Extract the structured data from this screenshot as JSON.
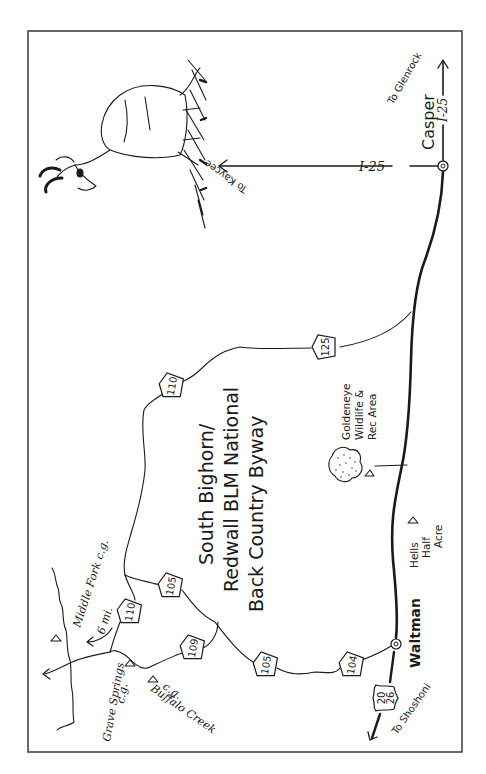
{
  "map": {
    "title_lines": [
      "South Bighorn/",
      "Redwall BLM National",
      "Back Country Byway"
    ],
    "orientation": "rotated 90° (north points right)",
    "cities": [
      {
        "name": "Casper"
      },
      {
        "name": "Waltman"
      }
    ],
    "interstate": {
      "label_west": "I-25",
      "label_east": "I-25"
    },
    "destinations": {
      "kaycee": "To Kaycee",
      "glenrock": "To Glenrock",
      "shoshoni": "To Shoshoni"
    },
    "routes": [
      {
        "id": "125",
        "label": "125"
      },
      {
        "id": "110a",
        "label": "110"
      },
      {
        "id": "110b",
        "label": "110"
      },
      {
        "id": "105a",
        "label": "105"
      },
      {
        "id": "105b",
        "label": "105"
      },
      {
        "id": "109",
        "label": "109"
      },
      {
        "id": "104",
        "label": "104"
      },
      {
        "id": "us20",
        "label": "20"
      },
      {
        "id": "us26",
        "label": "26"
      }
    ],
    "places": {
      "goldeneye_1": "Goldeneye",
      "goldeneye_2": "Wildlife &",
      "goldeneye_3": "Rec Area",
      "hells_1": "Hells",
      "hells_2": "Half",
      "hells_3": "Acre",
      "middle_fork": "Middle Fork c.g.",
      "six_mi": "6 mi.",
      "grave_1": "Grave Springs",
      "grave_2": "c.g.",
      "buffalo_1": "Buffalo Creek",
      "buffalo_2": "c.g."
    },
    "illustration": "pronghorn antelope in grass",
    "colors": {
      "ink": "#1a1a1a",
      "paper": "#ffffff",
      "border": "#444444"
    }
  }
}
